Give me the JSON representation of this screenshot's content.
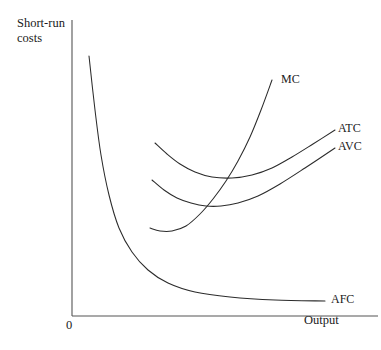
{
  "figure": {
    "background_color": "#ffffff",
    "line_color": "#2b2b2b",
    "axis_color": "#555555",
    "text_color": "#1a1a1a"
  },
  "axes": {
    "y_title_line1": "Short-run",
    "y_title_line2": "costs",
    "x_title": "Output",
    "origin_label": "0"
  },
  "curve_labels": {
    "mc": "MC",
    "atc": "ATC",
    "avc": "AVC",
    "afc": "AFC"
  },
  "chart_data": {
    "type": "line",
    "xlabel": "Output",
    "ylabel": "Short-run costs",
    "grid": false,
    "legend_position": "inline-curve-end-labels",
    "axis_note": "Unlabeled qualitative axes; origin marked 0",
    "xlim": [
      0,
      1
    ],
    "ylim": [
      0,
      1
    ],
    "series": [
      {
        "name": "MC",
        "label": "MC",
        "description": "Marginal cost: J-shaped, falls to a minimum then rises steeply, cutting AVC and ATC at their minima",
        "points_px": [
          [
            150,
            228
          ],
          [
            160,
            231
          ],
          [
            172,
            231
          ],
          [
            186,
            226
          ],
          [
            200,
            214
          ],
          [
            213,
            199
          ],
          [
            226,
            181
          ],
          [
            238,
            161
          ],
          [
            250,
            137
          ],
          [
            261,
            110
          ],
          [
            272,
            80
          ]
        ]
      },
      {
        "name": "ATC",
        "label": "ATC",
        "description": "Average total cost: U-shaped, minimum where MC crosses it",
        "points_px": [
          [
            155,
            143
          ],
          [
            167,
            154
          ],
          [
            180,
            164
          ],
          [
            195,
            172
          ],
          [
            212,
            177
          ],
          [
            232,
            178
          ],
          [
            252,
            175
          ],
          [
            272,
            168
          ],
          [
            292,
            157
          ],
          [
            313,
            144
          ],
          [
            335,
            130
          ]
        ]
      },
      {
        "name": "AVC",
        "label": "AVC",
        "description": "Average variable cost: U-shaped, lies below ATC and converges toward it as output rises",
        "points_px": [
          [
            152,
            180
          ],
          [
            164,
            190
          ],
          [
            177,
            198
          ],
          [
            191,
            203
          ],
          [
            206,
            206
          ],
          [
            221,
            206
          ],
          [
            238,
            203
          ],
          [
            258,
            196
          ],
          [
            280,
            184
          ],
          [
            305,
            168
          ],
          [
            335,
            148
          ]
        ]
      },
      {
        "name": "AFC",
        "label": "AFC",
        "description": "Average fixed cost: rectangular hyperbola falling steeply then flattening asymptotically toward the output axis",
        "points_px": [
          [
            89,
            56
          ],
          [
            95,
            110
          ],
          [
            101,
            155
          ],
          [
            109,
            195
          ],
          [
            119,
            228
          ],
          [
            132,
            252
          ],
          [
            148,
            270
          ],
          [
            168,
            283
          ],
          [
            195,
            292
          ],
          [
            230,
            297
          ],
          [
            275,
            300
          ],
          [
            325,
            301
          ]
        ]
      }
    ],
    "axis_lines_px": {
      "y_axis": [
        [
          72,
          20
        ],
        [
          72,
          316
        ]
      ],
      "x_axis": [
        [
          72,
          316
        ],
        [
          378,
          316
        ]
      ]
    }
  }
}
